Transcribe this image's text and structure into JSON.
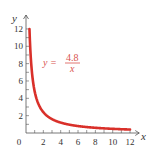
{
  "chart_data": {
    "type": "line",
    "title": "",
    "function": "y = 4.8/x",
    "annotation": {
      "lhs": "y =",
      "numerator": "4.8",
      "denominator": "x"
    },
    "xlabel": "x",
    "ylabel": "y",
    "xlim": [
      0,
      12.6
    ],
    "ylim": [
      0,
      13
    ],
    "x_ticks": [
      0,
      2,
      4,
      6,
      8,
      10,
      12
    ],
    "y_ticks": [
      2,
      4,
      6,
      8,
      10,
      12
    ],
    "x_tick_labels": [
      "0",
      "2",
      "4",
      "6",
      "8",
      "10",
      "12"
    ],
    "y_tick_labels": [
      "2",
      "4",
      "6",
      "8",
      "10",
      "12"
    ],
    "grid": false,
    "series": [
      {
        "name": "y = 4.8/x",
        "color": "#d9302a",
        "x": [
          0.4,
          0.5,
          0.6,
          0.8,
          1,
          1.5,
          2,
          2.5,
          3,
          4,
          5,
          6,
          7,
          8,
          9,
          10,
          11,
          12
        ],
        "y": [
          12,
          9.6,
          8,
          6,
          4.8,
          3.2,
          2.4,
          1.92,
          1.6,
          1.2,
          0.96,
          0.8,
          0.686,
          0.6,
          0.533,
          0.48,
          0.436,
          0.4
        ]
      }
    ]
  },
  "colors": {
    "curve": "#d9302a",
    "axis": "#555555",
    "text": "#333333",
    "annotation": "#d9534f"
  }
}
